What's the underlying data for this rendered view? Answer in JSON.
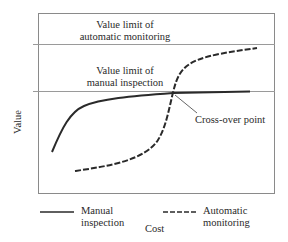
{
  "diagram": {
    "y_axis_label": "Value",
    "x_axis_label": "Cost",
    "upper_limit_label": [
      "Value limit of",
      "automatic monitoring"
    ],
    "lower_limit_label": [
      "Value limit of",
      "manual inspection"
    ],
    "annotation": "Cross-over point",
    "legend": [
      {
        "style": "solid",
        "label": [
          "Manual",
          "inspection"
        ]
      },
      {
        "style": "dashed",
        "label": [
          "Automatic",
          "monitoring"
        ]
      }
    ],
    "colors": {
      "line": "#2a2a2a",
      "axis": "#888888",
      "limit_line": "#999999"
    }
  }
}
